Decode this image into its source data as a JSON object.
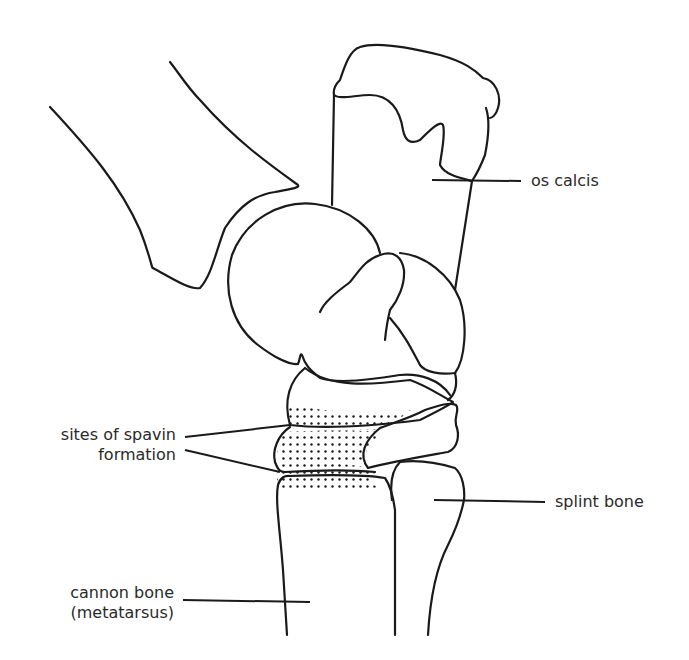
{
  "diagram": {
    "labels": {
      "os_calcis": "os calcis",
      "spavin_line1": "sites of spavin",
      "spavin_line2": "formation",
      "splint_bone": "splint bone",
      "cannon_line1": "cannon bone",
      "cannon_line2": "(metatarsus)"
    },
    "colors": {
      "line": "#1a1a1a",
      "text": "#2a2a2a",
      "background": "#ffffff"
    }
  }
}
